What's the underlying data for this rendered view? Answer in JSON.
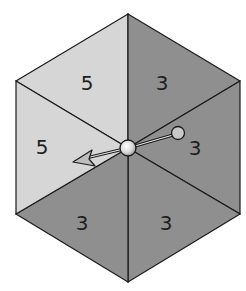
{
  "spinner": {
    "shape": "hexagon",
    "colors": {
      "light": "#d6d6d6",
      "dark": "#8f8f8f",
      "edge": "#1a1a1a"
    },
    "sections": [
      {
        "label": "5",
        "shade": "light"
      },
      {
        "label": "3",
        "shade": "dark"
      },
      {
        "label": "3",
        "shade": "dark"
      },
      {
        "label": "3",
        "shade": "dark"
      },
      {
        "label": "3",
        "shade": "dark"
      },
      {
        "label": "5",
        "shade": "light"
      }
    ],
    "arrow": {
      "points_to_section": "5"
    }
  }
}
